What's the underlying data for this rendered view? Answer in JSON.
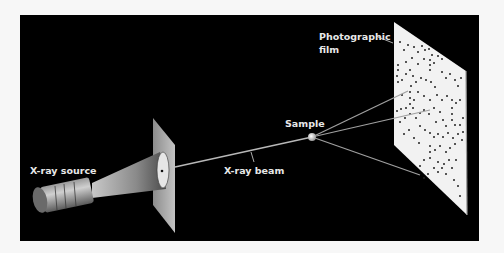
{
  "diagram": {
    "labels": {
      "source": "X-ray source",
      "beam": "X-ray beam",
      "sample": "Sample",
      "film_line1": "Photographic",
      "film_line2": "film"
    },
    "colors": {
      "background": "#000000",
      "page": "#f7f7f7",
      "film": "#f2f2f2",
      "aperture_plate": "#a8a8a8",
      "beam": "#b8b8b8",
      "label": "#e8e8e8",
      "spot": "#222222"
    },
    "components": [
      "X-ray source",
      "collimator aperture",
      "X-ray beam",
      "Sample",
      "Photographic film"
    ]
  }
}
